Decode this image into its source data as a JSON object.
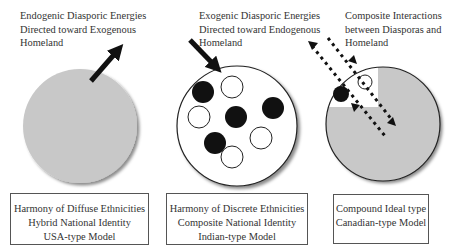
{
  "panels": [
    {
      "caption": [
        "Endogenic Diasporic Energies",
        "Directed toward Exogenous",
        "Homeland"
      ],
      "box": [
        "Harmony of Diffuse Ethnicities",
        "Hybrid National Identity",
        "USA-type Model"
      ]
    },
    {
      "caption": [
        "Exogenic Diasporic Energies",
        "Directed toward Endogenous",
        "Homeland"
      ],
      "box": [
        "Harmony of Discrete Ethnicities",
        "Composite National Identity",
        "Indian-type Model"
      ]
    },
    {
      "caption": [
        "Composite Interactions",
        "between Diasporas and",
        "Homeland"
      ],
      "box": [
        "Compound Ideal type",
        "Canadian-type Model"
      ]
    }
  ],
  "colors": {
    "fill_gray": "#c8c8c8",
    "outline": "#222222",
    "black_dot": "#111111",
    "white_dot": "#ffffff"
  }
}
